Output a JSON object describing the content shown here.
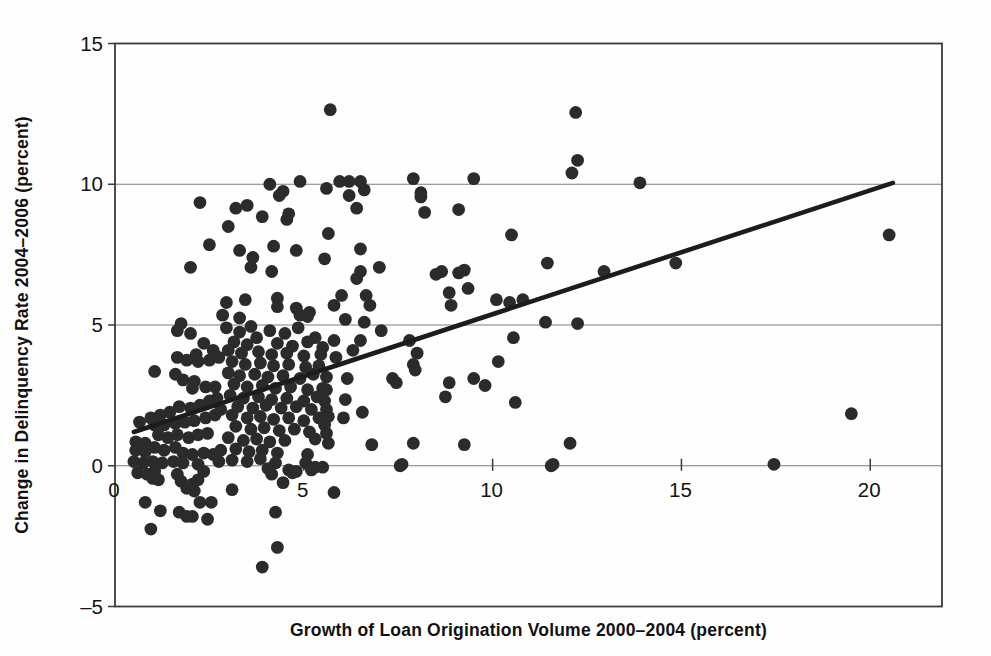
{
  "figure": {
    "background": "#fefefe",
    "dot_color": "#2b2b2b",
    "trend_color": "#1c1c1c",
    "grid_color": "#7d7d7d",
    "border_color": "#3b3b3b",
    "text_color": "#141414"
  },
  "chart_data": {
    "type": "scatter",
    "title": "",
    "xlabel": "Growth of Loan Origination Volume 2000–2004 (percent)",
    "ylabel": "Change in Delinquency Rate 2004–2006 (percent)",
    "xlim": [
      0,
      21.9
    ],
    "ylim": [
      -5,
      15
    ],
    "x_ticks": [
      5,
      10,
      15,
      20
    ],
    "x_tick_labels": [
      "0",
      "5",
      "10",
      "15",
      "20"
    ],
    "x_tick_label_values": [
      0,
      5,
      10,
      15,
      20
    ],
    "y_ticks": [
      -5,
      0,
      5,
      10,
      15
    ],
    "y_tick_labels": [
      "–5",
      "0",
      "5",
      "10",
      "15"
    ],
    "gridlines_y": [
      0,
      5,
      10
    ],
    "grid": "horizontal-only",
    "legend_position": "none",
    "trend_line": {
      "x1": 0.5,
      "y1": 1.2,
      "x2": 20.6,
      "y2": 10.05
    },
    "points": [
      [
        5.7,
        12.65
      ],
      [
        12.2,
        12.55
      ],
      [
        4.1,
        10.0
      ],
      [
        4.45,
        9.75
      ],
      [
        4.9,
        10.1
      ],
      [
        5.6,
        9.85
      ],
      [
        5.95,
        10.1
      ],
      [
        6.2,
        10.1
      ],
      [
        6.5,
        10.1
      ],
      [
        6.6,
        9.8
      ],
      [
        7.9,
        10.2
      ],
      [
        8.1,
        9.7
      ],
      [
        9.5,
        10.2
      ],
      [
        12.25,
        10.85
      ],
      [
        12.1,
        10.4
      ],
      [
        13.9,
        10.05
      ],
      [
        2.25,
        9.35
      ],
      [
        3.2,
        9.15
      ],
      [
        3.5,
        9.25
      ],
      [
        3.9,
        8.85
      ],
      [
        4.35,
        9.6
      ],
      [
        4.55,
        8.75
      ],
      [
        4.6,
        8.95
      ],
      [
        6.2,
        9.6
      ],
      [
        6.4,
        9.15
      ],
      [
        8.1,
        9.55
      ],
      [
        8.2,
        9.0
      ],
      [
        9.1,
        9.1
      ],
      [
        3.0,
        8.5
      ],
      [
        2.5,
        7.85
      ],
      [
        2.0,
        7.05
      ],
      [
        3.3,
        7.65
      ],
      [
        3.65,
        7.4
      ],
      [
        3.6,
        7.05
      ],
      [
        4.15,
        6.9
      ],
      [
        4.2,
        7.8
      ],
      [
        4.8,
        7.65
      ],
      [
        5.65,
        8.25
      ],
      [
        5.55,
        7.35
      ],
      [
        6.5,
        7.7
      ],
      [
        10.5,
        8.2
      ],
      [
        6.5,
        6.9
      ],
      [
        7.0,
        7.05
      ],
      [
        6.4,
        6.65
      ],
      [
        8.5,
        6.8
      ],
      [
        8.65,
        6.9
      ],
      [
        9.1,
        6.85
      ],
      [
        9.25,
        6.95
      ],
      [
        8.85,
        6.15
      ],
      [
        9.35,
        6.3
      ],
      [
        8.9,
        5.7
      ],
      [
        10.1,
        5.9
      ],
      [
        10.45,
        5.8
      ],
      [
        10.8,
        5.9
      ],
      [
        11.45,
        7.2
      ],
      [
        12.95,
        6.9
      ],
      [
        14.85,
        7.2
      ],
      [
        20.5,
        8.2
      ],
      [
        1.75,
        5.05
      ],
      [
        2.95,
        5.8
      ],
      [
        2.85,
        5.35
      ],
      [
        3.45,
        5.9
      ],
      [
        3.3,
        5.25
      ],
      [
        4.3,
        5.95
      ],
      [
        4.3,
        5.65
      ],
      [
        4.8,
        5.6
      ],
      [
        4.9,
        5.35
      ],
      [
        5.15,
        5.45
      ],
      [
        5.1,
        5.3
      ],
      [
        5.8,
        5.7
      ],
      [
        6.0,
        6.05
      ],
      [
        6.1,
        5.2
      ],
      [
        6.65,
        6.05
      ],
      [
        6.75,
        5.7
      ],
      [
        6.6,
        5.1
      ],
      [
        11.4,
        5.1
      ],
      [
        12.25,
        5.05
      ],
      [
        5.8,
        4.45
      ],
      [
        5.85,
        3.85
      ],
      [
        6.3,
        4.1
      ],
      [
        6.5,
        4.45
      ],
      [
        7.05,
        4.8
      ],
      [
        7.8,
        4.45
      ],
      [
        8.0,
        4.0
      ],
      [
        7.9,
        3.6
      ],
      [
        7.95,
        3.4
      ],
      [
        7.35,
        3.1
      ],
      [
        7.45,
        2.95
      ],
      [
        6.15,
        3.1
      ],
      [
        6.1,
        2.35
      ],
      [
        6.05,
        1.7
      ],
      [
        6.55,
        1.9
      ],
      [
        6.8,
        0.75
      ],
      [
        7.9,
        0.8
      ],
      [
        7.6,
        0.05
      ],
      [
        8.75,
        2.45
      ],
      [
        8.85,
        2.95
      ],
      [
        9.5,
        3.1
      ],
      [
        9.8,
        2.85
      ],
      [
        10.15,
        3.7
      ],
      [
        10.55,
        4.55
      ],
      [
        10.6,
        2.25
      ],
      [
        9.25,
        0.75
      ],
      [
        12.05,
        0.8
      ],
      [
        11.6,
        0.05
      ],
      [
        19.5,
        1.85
      ],
      [
        17.45,
        0.05
      ],
      [
        7.55,
        0.0
      ],
      [
        11.55,
        0.0
      ],
      [
        5.6,
        2.7
      ],
      [
        5.55,
        2.3
      ],
      [
        5.6,
        2.0
      ],
      [
        5.65,
        1.75
      ],
      [
        5.55,
        1.45
      ],
      [
        5.6,
        1.15
      ],
      [
        5.65,
        0.8
      ],
      [
        1.65,
        4.8
      ],
      [
        2.0,
        4.7
      ],
      [
        2.35,
        4.35
      ],
      [
        2.6,
        4.1
      ],
      [
        1.65,
        3.85
      ],
      [
        1.9,
        3.75
      ],
      [
        2.15,
        3.95
      ],
      [
        2.2,
        3.7
      ],
      [
        2.5,
        3.75
      ],
      [
        2.75,
        3.85
      ],
      [
        1.05,
        3.35
      ],
      [
        1.6,
        3.25
      ],
      [
        1.8,
        3.05
      ],
      [
        2.1,
        3.0
      ],
      [
        2.05,
        2.75
      ],
      [
        2.4,
        2.8
      ],
      [
        2.65,
        2.8
      ],
      [
        2.7,
        2.4
      ],
      [
        2.5,
        2.3
      ],
      [
        2.25,
        2.15
      ],
      [
        2.0,
        2.05
      ],
      [
        1.7,
        2.1
      ],
      [
        1.45,
        1.9
      ],
      [
        1.2,
        1.8
      ],
      [
        0.95,
        1.7
      ],
      [
        0.65,
        1.55
      ],
      [
        1.05,
        1.45
      ],
      [
        1.3,
        1.45
      ],
      [
        1.6,
        1.5
      ],
      [
        1.85,
        1.55
      ],
      [
        2.1,
        1.6
      ],
      [
        2.4,
        1.7
      ],
      [
        2.65,
        1.8
      ],
      [
        2.8,
        2.0
      ],
      [
        1.15,
        1.1
      ],
      [
        1.4,
        1.0
      ],
      [
        1.65,
        1.1
      ],
      [
        1.95,
        1.0
      ],
      [
        2.2,
        1.1
      ],
      [
        2.45,
        1.15
      ],
      [
        0.55,
        0.85
      ],
      [
        0.8,
        0.8
      ],
      [
        0.55,
        0.55
      ],
      [
        0.8,
        0.5
      ],
      [
        1.05,
        0.65
      ],
      [
        1.3,
        0.55
      ],
      [
        1.6,
        0.65
      ],
      [
        1.8,
        0.45
      ],
      [
        2.05,
        0.4
      ],
      [
        2.35,
        0.45
      ],
      [
        2.6,
        0.4
      ],
      [
        2.8,
        0.55
      ],
      [
        0.5,
        0.15
      ],
      [
        0.75,
        0.1
      ],
      [
        1.0,
        0.15
      ],
      [
        1.25,
        0.1
      ],
      [
        1.55,
        0.15
      ],
      [
        1.8,
        0.1
      ],
      [
        2.75,
        0.15
      ],
      [
        2.2,
        0.05
      ],
      [
        2.95,
        4.9
      ],
      [
        3.3,
        4.75
      ],
      [
        3.6,
        4.95
      ],
      [
        3.75,
        4.55
      ],
      [
        4.1,
        4.8
      ],
      [
        4.5,
        4.7
      ],
      [
        4.85,
        4.9
      ],
      [
        5.3,
        4.55
      ],
      [
        3.15,
        4.4
      ],
      [
        3.5,
        4.3
      ],
      [
        4.3,
        4.35
      ],
      [
        4.7,
        4.25
      ],
      [
        5.1,
        4.4
      ],
      [
        5.5,
        4.2
      ],
      [
        3.0,
        4.1
      ],
      [
        3.35,
        4.0
      ],
      [
        3.8,
        4.05
      ],
      [
        4.15,
        3.95
      ],
      [
        4.55,
        4.0
      ],
      [
        5.0,
        3.9
      ],
      [
        5.45,
        3.95
      ],
      [
        3.1,
        3.7
      ],
      [
        3.45,
        3.6
      ],
      [
        3.85,
        3.65
      ],
      [
        4.2,
        3.55
      ],
      [
        4.6,
        3.6
      ],
      [
        5.05,
        3.5
      ],
      [
        5.4,
        3.55
      ],
      [
        3.0,
        3.3
      ],
      [
        3.3,
        3.2
      ],
      [
        3.7,
        3.25
      ],
      [
        4.05,
        3.15
      ],
      [
        4.45,
        3.2
      ],
      [
        4.9,
        3.1
      ],
      [
        5.25,
        3.25
      ],
      [
        5.6,
        3.15
      ],
      [
        3.15,
        2.9
      ],
      [
        3.5,
        2.8
      ],
      [
        3.9,
        2.85
      ],
      [
        4.25,
        2.75
      ],
      [
        4.65,
        2.8
      ],
      [
        5.1,
        2.7
      ],
      [
        5.5,
        2.75
      ],
      [
        3.05,
        2.5
      ],
      [
        3.4,
        2.4
      ],
      [
        3.8,
        2.45
      ],
      [
        4.15,
        2.35
      ],
      [
        4.55,
        2.4
      ],
      [
        5.0,
        2.3
      ],
      [
        5.35,
        2.45
      ],
      [
        3.25,
        2.1
      ],
      [
        3.65,
        2.05
      ],
      [
        4.0,
        2.15
      ],
      [
        4.4,
        2.05
      ],
      [
        4.8,
        2.1
      ],
      [
        5.2,
        2.0
      ],
      [
        3.1,
        1.8
      ],
      [
        3.5,
        1.7
      ],
      [
        3.85,
        1.75
      ],
      [
        4.2,
        1.65
      ],
      [
        4.6,
        1.7
      ],
      [
        5.0,
        1.6
      ],
      [
        5.4,
        1.7
      ],
      [
        3.2,
        1.4
      ],
      [
        3.6,
        1.3
      ],
      [
        3.95,
        1.35
      ],
      [
        4.35,
        1.25
      ],
      [
        4.75,
        1.3
      ],
      [
        5.15,
        1.2
      ],
      [
        3.0,
        1.0
      ],
      [
        3.4,
        0.9
      ],
      [
        3.75,
        0.95
      ],
      [
        4.1,
        0.85
      ],
      [
        4.5,
        0.9
      ],
      [
        5.3,
        0.95
      ],
      [
        3.2,
        0.6
      ],
      [
        3.55,
        0.5
      ],
      [
        3.9,
        0.55
      ],
      [
        4.3,
        0.45
      ],
      [
        5.1,
        0.4
      ],
      [
        3.1,
        0.2
      ],
      [
        3.5,
        0.15
      ],
      [
        3.85,
        0.25
      ],
      [
        4.25,
        0.1
      ],
      [
        5.05,
        0.1
      ],
      [
        0.6,
        -0.25
      ],
      [
        0.85,
        -0.3
      ],
      [
        1.0,
        -0.45
      ],
      [
        1.15,
        -0.5
      ],
      [
        1.05,
        -0.2
      ],
      [
        1.65,
        -0.3
      ],
      [
        1.75,
        -0.55
      ],
      [
        1.9,
        -0.8
      ],
      [
        2.05,
        -0.65
      ],
      [
        2.1,
        -0.9
      ],
      [
        2.2,
        -0.5
      ],
      [
        2.35,
        -0.2
      ],
      [
        3.1,
        -0.85
      ],
      [
        2.25,
        -1.3
      ],
      [
        2.55,
        -1.3
      ],
      [
        2.45,
        -1.9
      ],
      [
        1.7,
        -1.65
      ],
      [
        1.9,
        -1.8
      ],
      [
        2.05,
        -1.8
      ],
      [
        0.8,
        -1.3
      ],
      [
        1.2,
        -1.6
      ],
      [
        0.95,
        -2.25
      ],
      [
        4.25,
        -1.65
      ],
      [
        4.3,
        -2.9
      ],
      [
        3.9,
        -3.6
      ],
      [
        5.8,
        -0.95
      ],
      [
        4.15,
        -0.3
      ],
      [
        4.45,
        -0.6
      ],
      [
        4.6,
        -0.15
      ],
      [
        4.7,
        -0.25
      ],
      [
        4.8,
        -0.2
      ],
      [
        5.2,
        -0.15
      ],
      [
        5.3,
        -0.05
      ],
      [
        5.5,
        -0.05
      ],
      [
        4.05,
        -0.1
      ]
    ]
  }
}
